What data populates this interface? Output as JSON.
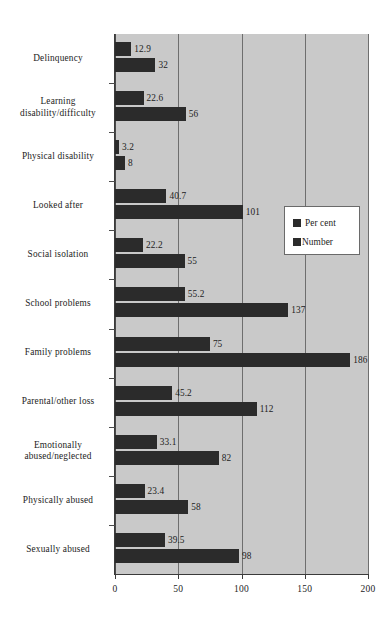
{
  "chart_data": {
    "type": "bar",
    "orientation": "horizontal",
    "title": "",
    "subtitle": "",
    "xlabel": "",
    "ylabel": "",
    "xlim": [
      0,
      200
    ],
    "xticks": [
      0,
      50,
      100,
      150,
      200
    ],
    "xtick_labels": [
      "0",
      "50",
      "100",
      "150",
      "200"
    ],
    "grid": true,
    "grid_axis": "x",
    "legend_position": "center-right",
    "plot_background": "#c9c9c9",
    "bar_color": "#2b2b2b",
    "categories": [
      "Delinquency",
      "Learning disability/difficulty",
      "Physical disability",
      "Looked after",
      "Social isolation",
      "School problems",
      "Family problems",
      "Parental/other loss",
      "Emotionally abused/neglected",
      "Physically abused",
      "Sexually abused"
    ],
    "category_lines": [
      [
        "Delinquency"
      ],
      [
        "Learning",
        "disability/difficulty"
      ],
      [
        "Physical disability"
      ],
      [
        "Looked after"
      ],
      [
        "Social isolation"
      ],
      [
        "School problems"
      ],
      [
        "Family problems"
      ],
      [
        "Parental/other loss"
      ],
      [
        "Emotionally",
        "abused/neglected"
      ],
      [
        "Physically abused"
      ],
      [
        "Sexually abused"
      ]
    ],
    "series": [
      {
        "name": "Per cent",
        "values": [
          12.9,
          22.6,
          3.2,
          40.7,
          22.2,
          55.2,
          75,
          45.2,
          33.1,
          23.4,
          39.5
        ],
        "labels": [
          "12.9",
          "22.6",
          "3.2",
          "40.7",
          "22.2",
          "55.2",
          "75",
          "45.2",
          "33.1",
          "23.4",
          "39.5"
        ]
      },
      {
        "name": "Number",
        "values": [
          32,
          56,
          8,
          101,
          55,
          137,
          186,
          112,
          82,
          58,
          98
        ],
        "labels": [
          "32",
          "56",
          "8",
          "101",
          "55",
          "137",
          "186",
          "112",
          "82",
          "58",
          "98"
        ]
      }
    ]
  },
  "legend": {
    "entries": [
      {
        "label": "Per cent",
        "swatch": "legend-swatch-per-cent"
      },
      {
        "label": "Number",
        "swatch": "legend-swatch-number"
      }
    ]
  }
}
